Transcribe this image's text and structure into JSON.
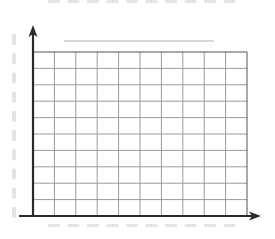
{
  "chart_data": {
    "type": "table",
    "title": "",
    "xlabel": "",
    "ylabel": "",
    "categories": [],
    "values": [],
    "grid": true,
    "grid_columns": 10,
    "grid_rows": 10,
    "legend": null,
    "note": "Blank graph-paper chart template with axes and placeholder dash marks; no data plotted"
  },
  "layout": {
    "plot_left": 33,
    "plot_right": 247,
    "plot_top": 52,
    "plot_bottom": 216,
    "title_placeholder": {
      "x1": 64,
      "x2": 214,
      "y": 41
    },
    "y_axis_arrow_top": 25,
    "x_axis_arrow_right": 261,
    "x_axis_start": 19
  },
  "colors": {
    "axis": "#2a2a2a",
    "grid_line": "#9a9a9a",
    "grid_border": "#555555",
    "placeholder": "#e4e4e4",
    "title_placeholder": "#d8d8d8",
    "background": "#ffffff"
  }
}
